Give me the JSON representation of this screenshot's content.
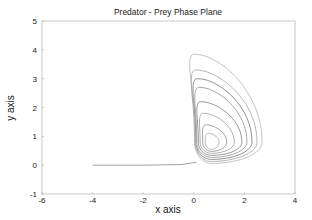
{
  "chart_data": {
    "type": "line",
    "title": "Predator - Prey Phase Plane",
    "xlabel": "x axis",
    "ylabel": "y axis",
    "xlim": [
      -6,
      4
    ],
    "ylim": [
      -1,
      5
    ],
    "xticks": [
      "-6",
      "-4",
      "-2",
      "0",
      "2",
      "4"
    ],
    "yticks": [
      "-1",
      "0",
      "1",
      "2",
      "3",
      "4",
      "5"
    ],
    "grid": false,
    "legend": null,
    "center": {
      "x": 0.7,
      "y": 0.8
    },
    "series": [
      {
        "name": "orbit-1",
        "xmin": 0.45,
        "xmax": 1.0,
        "ymax": 1.1
      },
      {
        "name": "orbit-2",
        "xmin": 0.35,
        "xmax": 1.3,
        "ymax": 1.4
      },
      {
        "name": "orbit-3",
        "xmin": 0.25,
        "xmax": 1.6,
        "ymax": 1.8
      },
      {
        "name": "orbit-4",
        "xmin": 0.18,
        "xmax": 1.9,
        "ymax": 2.2
      },
      {
        "name": "orbit-5",
        "xmin": 0.12,
        "xmax": 2.1,
        "ymax": 2.7
      },
      {
        "name": "orbit-6",
        "xmin": 0.08,
        "xmax": 2.3,
        "ymax": 3.0
      },
      {
        "name": "orbit-7",
        "xmin": 0.05,
        "xmax": 2.5,
        "ymax": 3.3
      },
      {
        "name": "orbit-8",
        "xmin": 0.03,
        "xmax": 2.7,
        "ymax": 3.85
      },
      {
        "name": "incoming-trajectory",
        "x": [
          -4,
          -2,
          -0.5,
          0.1
        ],
        "y": [
          0,
          0,
          0.02,
          0.1
        ]
      }
    ]
  }
}
